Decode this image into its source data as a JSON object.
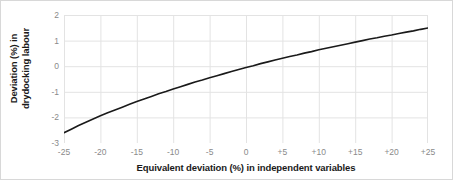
{
  "chart_data": {
    "type": "line",
    "title": "",
    "xlabel": "Equivalent deviation (%) in independent variables",
    "ylabel_lines": [
      "Deviation (%) in",
      "drydocking labour"
    ],
    "ylabel": "Deviation (%) in drydocking labour",
    "xlim": [
      -25,
      25
    ],
    "ylim": [
      -3,
      2
    ],
    "xticks": [
      -25,
      -20,
      -15,
      -10,
      -5,
      0,
      5,
      10,
      15,
      20,
      25
    ],
    "xtick_labels": [
      "-25",
      "-20",
      "-15",
      "-10",
      "-5",
      "0",
      "+5",
      "+10",
      "+15",
      "+20",
      "+25"
    ],
    "yticks": [
      2,
      1,
      0,
      -1,
      -2,
      -3
    ],
    "ytick_labels": [
      "2",
      "1",
      "0",
      "-1",
      "-2",
      "-3"
    ],
    "grid": true,
    "grid_color": "#e3e3e3",
    "legend": null,
    "series": [
      {
        "name": "Deviation in drydocking labour",
        "color": "#1a1a1a",
        "line_width": 1.6,
        "x": [
          -25,
          -24,
          -23,
          -22,
          -21,
          -20,
          -19,
          -18,
          -17,
          -16,
          -15,
          -14,
          -13,
          -12,
          -11,
          -10,
          -9,
          -8,
          -7,
          -6,
          -5,
          -4,
          -3,
          -2,
          -1,
          0,
          1,
          2,
          3,
          4,
          5,
          6,
          7,
          8,
          9,
          10,
          11,
          12,
          13,
          14,
          15,
          16,
          17,
          18,
          19,
          20,
          21,
          22,
          23,
          24,
          25
        ],
        "values": [
          -2.6,
          -2.46,
          -2.32,
          -2.19,
          -2.06,
          -1.94,
          -1.82,
          -1.71,
          -1.6,
          -1.49,
          -1.38,
          -1.28,
          -1.18,
          -1.08,
          -0.99,
          -0.89,
          -0.8,
          -0.71,
          -0.62,
          -0.54,
          -0.45,
          -0.37,
          -0.29,
          -0.21,
          -0.13,
          -0.05,
          0.02,
          0.1,
          0.17,
          0.24,
          0.31,
          0.38,
          0.44,
          0.51,
          0.57,
          0.64,
          0.7,
          0.76,
          0.82,
          0.88,
          0.94,
          1.0,
          1.06,
          1.11,
          1.17,
          1.22,
          1.28,
          1.33,
          1.38,
          1.44,
          1.49
        ]
      }
    ]
  },
  "figure": {
    "background": "#ffffff",
    "border_color": "#d8d8d8",
    "axis_text_color": "#8a8a8a",
    "label_text_color": "#1a1a1a"
  }
}
